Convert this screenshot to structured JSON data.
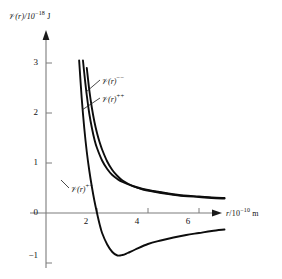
{
  "chart_data": {
    "type": "line",
    "title": "",
    "xlabel": "r/10^-10 m",
    "ylabel": "V(r)/10^-18 J",
    "xlim": [
      0,
      7.6
    ],
    "ylim": [
      -1.15,
      3.6
    ],
    "xticks": [
      2,
      4,
      6
    ],
    "yticks": [
      3,
      2,
      1,
      0,
      -1
    ],
    "grid": false,
    "legend_position": "inline-annotations",
    "series": [
      {
        "name": "V(r)^+-",
        "label_base": "(r)",
        "label_sup": "+−",
        "description": "attractive ion pair potential, crosses zero near r=2.0, minimum about -0.85 at r=2.8, approaches -0.33 at r=7",
        "x": [
          1.3,
          1.4,
          1.5,
          1.6,
          1.7,
          1.8,
          1.9,
          2.0,
          2.1,
          2.2,
          2.4,
          2.6,
          2.8,
          3.0,
          3.2,
          3.5,
          4.0,
          4.5,
          5.0,
          5.5,
          6.0,
          6.5,
          7.0
        ],
        "y": [
          3.05,
          2.3,
          1.7,
          1.22,
          0.84,
          0.52,
          0.24,
          0.0,
          -0.22,
          -0.4,
          -0.63,
          -0.78,
          -0.85,
          -0.84,
          -0.8,
          -0.73,
          -0.62,
          -0.55,
          -0.49,
          -0.44,
          -0.4,
          -0.36,
          -0.33
        ]
      },
      {
        "name": "V(r)^--",
        "label_base": "(r)",
        "label_sup": "−−",
        "description": "repulsive like-charge potential, falls from 3.05 at r=1.45 to about 0.30 at r=7",
        "x": [
          1.45,
          1.5,
          1.6,
          1.7,
          1.8,
          1.9,
          2.0,
          2.2,
          2.4,
          2.6,
          2.8,
          3.0,
          3.4,
          3.8,
          4.2,
          4.8,
          5.4,
          6.0,
          6.5,
          7.0
        ],
        "y": [
          3.05,
          2.8,
          2.35,
          1.98,
          1.7,
          1.47,
          1.3,
          1.05,
          0.88,
          0.76,
          0.68,
          0.62,
          0.54,
          0.48,
          0.44,
          0.39,
          0.35,
          0.33,
          0.31,
          0.3
        ]
      },
      {
        "name": "V(r)^++",
        "label_base": "(r)",
        "label_sup": "++",
        "description": "repulsive like-charge potential, slightly right of the minus-minus curve, falls from 2.90 at r=1.60 to about 0.29 at r=7",
        "x": [
          1.6,
          1.7,
          1.8,
          1.9,
          2.0,
          2.1,
          2.2,
          2.4,
          2.6,
          2.8,
          3.0,
          3.4,
          3.8,
          4.2,
          4.8,
          5.4,
          6.0,
          6.5,
          7.0
        ],
        "y": [
          2.9,
          2.45,
          2.1,
          1.82,
          1.6,
          1.42,
          1.27,
          1.03,
          0.86,
          0.74,
          0.65,
          0.54,
          0.47,
          0.43,
          0.38,
          0.34,
          0.32,
          0.3,
          0.29
        ]
      }
    ]
  },
  "axes": {
    "y_label_var": "𝒱",
    "y_label_rest": "(r)/10",
    "y_label_exp": "−18",
    "y_label_unit": "J",
    "x_label_var": "r",
    "x_label_rest": "/10",
    "x_label_exp": "−10",
    "x_label_unit": "m"
  },
  "ytick_labels": [
    "3",
    "2",
    "1",
    "0",
    "−1"
  ],
  "xtick_labels": [
    "2",
    "4",
    "6"
  ],
  "annotations": [
    {
      "var": "𝒱",
      "base": "(r)",
      "sup": "−−"
    },
    {
      "var": "𝒱",
      "base": "(r)",
      "sup": "++"
    },
    {
      "var": "𝒱",
      "base": "(r)",
      "sup": "+−"
    }
  ],
  "colors": {
    "curve": "#0d0d0d",
    "axis": "#7c7c7c",
    "text": "#111111",
    "background": "#ffffff"
  }
}
